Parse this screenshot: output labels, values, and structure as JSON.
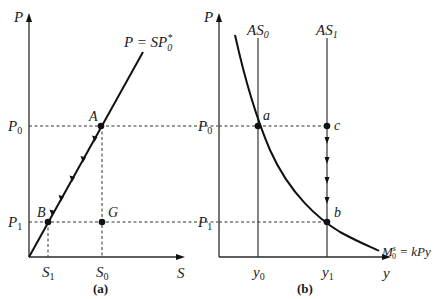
{
  "panel_a": {
    "caption": "(a)",
    "y_axis_label": "P",
    "x_axis_label": "S",
    "line_label": "P = SP",
    "line_label_sup": "*",
    "line_label_sub": "0",
    "p0_label": "P",
    "p0_sub": "0",
    "p1_label": "P",
    "p1_sub": "1",
    "s0_label": "S",
    "s0_sub": "0",
    "s1_label": "S",
    "s1_sub": "1",
    "points": {
      "A": "A",
      "B": "B",
      "G": "G"
    }
  },
  "panel_b": {
    "caption": "(b)",
    "y_axis_label": "P",
    "x_axis_label": "y",
    "as0_label": "AS",
    "as0_sub": "0",
    "as1_label": "AS",
    "as1_sub": "1",
    "curve_label_main": "M",
    "curve_label_sup": "s",
    "curve_label_sub": "0",
    "curve_label_rest": " = kPy",
    "p0_label": "P",
    "p0_sub": "0",
    "p1_label": "P",
    "p1_sub": "1",
    "y0_label": "y",
    "y0_sub": "0",
    "y1_label": "y",
    "y1_sub": "1",
    "points": {
      "a": "a",
      "b": "b",
      "c": "c"
    }
  }
}
